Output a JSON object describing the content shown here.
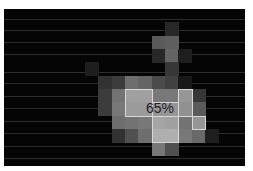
{
  "overlay": {
    "label": "65%",
    "label_pos": {
      "x": 146,
      "y": 95
    },
    "grid": {
      "origin_x": 1,
      "origin_y": 0,
      "cell": 13.33
    },
    "cells": [
      {
        "c": 6,
        "r": 4,
        "g": 30
      },
      {
        "c": 12,
        "r": 4,
        "g": 30
      },
      {
        "c": 12,
        "r": 1,
        "g": 40
      },
      {
        "c": 11,
        "r": 2,
        "g": 90
      },
      {
        "c": 12,
        "r": 2,
        "g": 95
      },
      {
        "c": 11,
        "r": 3,
        "g": 40
      },
      {
        "c": 12,
        "r": 3,
        "g": 100
      },
      {
        "c": 12,
        "r": 4,
        "g": 55
      },
      {
        "c": 13,
        "r": 3,
        "g": 30
      },
      {
        "c": 7,
        "r": 5,
        "g": 50
      },
      {
        "c": 8,
        "r": 5,
        "g": 60
      },
      {
        "c": 9,
        "r": 5,
        "g": 110
      },
      {
        "c": 10,
        "r": 5,
        "g": 100
      },
      {
        "c": 11,
        "r": 5,
        "g": 75
      },
      {
        "c": 12,
        "r": 5,
        "g": 65
      },
      {
        "c": 13,
        "r": 5,
        "g": 25
      },
      {
        "c": 7,
        "r": 6,
        "g": 60
      },
      {
        "c": 8,
        "r": 6,
        "g": 115
      },
      {
        "c": 9,
        "r": 6,
        "g": 160
      },
      {
        "c": 10,
        "r": 6,
        "g": 160
      },
      {
        "c": 11,
        "r": 6,
        "g": 120
      },
      {
        "c": 12,
        "r": 6,
        "g": 120
      },
      {
        "c": 13,
        "r": 6,
        "g": 150
      },
      {
        "c": 14,
        "r": 6,
        "g": 55
      },
      {
        "c": 7,
        "r": 7,
        "g": 60
      },
      {
        "c": 8,
        "r": 7,
        "g": 120
      },
      {
        "c": 9,
        "r": 7,
        "g": 155
      },
      {
        "c": 10,
        "r": 7,
        "g": 155
      },
      {
        "c": 11,
        "r": 7,
        "g": 150
      },
      {
        "c": 12,
        "r": 7,
        "g": 150
      },
      {
        "c": 13,
        "r": 7,
        "g": 145
      },
      {
        "c": 14,
        "r": 7,
        "g": 90
      },
      {
        "c": 8,
        "r": 8,
        "g": 110
      },
      {
        "c": 9,
        "r": 8,
        "g": 115
      },
      {
        "c": 10,
        "r": 8,
        "g": 120
      },
      {
        "c": 11,
        "r": 8,
        "g": 165
      },
      {
        "c": 12,
        "r": 8,
        "g": 160
      },
      {
        "c": 13,
        "r": 8,
        "g": 115
      },
      {
        "c": 14,
        "r": 8,
        "g": 150
      },
      {
        "c": 8,
        "r": 9,
        "g": 50
      },
      {
        "c": 9,
        "r": 9,
        "g": 80
      },
      {
        "c": 10,
        "r": 9,
        "g": 110
      },
      {
        "c": 11,
        "r": 9,
        "g": 175
      },
      {
        "c": 12,
        "r": 9,
        "g": 175
      },
      {
        "c": 13,
        "r": 9,
        "g": 120
      },
      {
        "c": 14,
        "r": 9,
        "g": 105
      },
      {
        "c": 15,
        "r": 9,
        "g": 30
      },
      {
        "c": 11,
        "r": 10,
        "g": 120
      },
      {
        "c": 12,
        "r": 10,
        "g": 80
      }
    ],
    "outlines": [
      {
        "c": 9,
        "r": 6,
        "w": 2,
        "h": 2
      },
      {
        "c": 13,
        "r": 6,
        "w": 1,
        "h": 2
      },
      {
        "c": 11,
        "r": 7,
        "w": 2,
        "h": 1
      },
      {
        "c": 11,
        "r": 8,
        "w": 2,
        "h": 2
      },
      {
        "c": 14,
        "r": 8,
        "w": 1,
        "h": 1
      }
    ],
    "scanlines": [
      10,
      21,
      33,
      45,
      63,
      74,
      87,
      99,
      112,
      124,
      137,
      149
    ]
  }
}
